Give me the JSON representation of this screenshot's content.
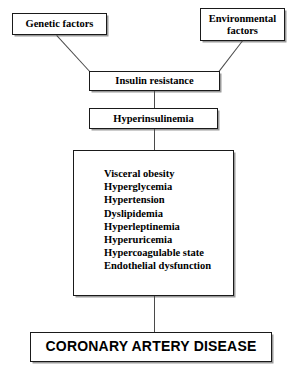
{
  "diagram": {
    "background_color": "#ffffff",
    "line_color": "#4a4a4a",
    "border_color": "#1a1a1a",
    "nodes": {
      "genetic": "Genetic factors",
      "environmental_line1": "Environmental",
      "environmental_line2": "factors",
      "insulin_resistance": "Insulin resistance",
      "hyperinsulinemia": "Hyperinsulinemia",
      "outcome": "CORONARY ARTERY DISEASE"
    },
    "features": [
      "Visceral obesity",
      "Hyperglycemia",
      "Hypertension",
      "Dyslipidemia",
      "Hyperleptinemia",
      "Hyperuricemia",
      "Hypercoagulable state",
      "Endothelial dysfunction"
    ],
    "edges": [
      {
        "from": "Genetic factors",
        "to": "Insulin resistance"
      },
      {
        "from": "Environmental factors",
        "to": "Insulin resistance"
      },
      {
        "from": "Insulin resistance",
        "to": "Hyperinsulinemia"
      },
      {
        "from": "Hyperinsulinemia",
        "to": "Metabolic features"
      },
      {
        "from": "Metabolic features",
        "to": "CORONARY ARTERY DISEASE"
      }
    ]
  }
}
